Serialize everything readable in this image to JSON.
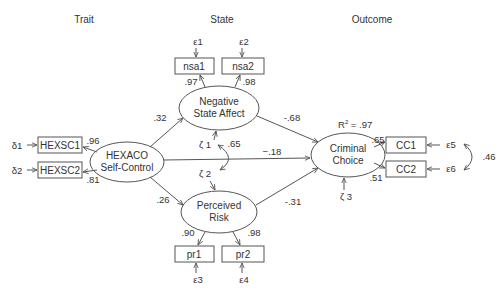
{
  "headers": {
    "trait": "Trait",
    "state": "State",
    "outcome": "Outcome"
  },
  "latent": {
    "hexaco": {
      "line1": "HEXACO",
      "line2": "Self-Control"
    },
    "nsa": {
      "line1": "Negative",
      "line2": "State Affect"
    },
    "pr": {
      "line1": "Perceived",
      "line2": "Risk"
    },
    "cc": {
      "line1": "Criminal",
      "line2": "Choice"
    }
  },
  "indicators": {
    "hexsc1": "HEXSC1",
    "hexsc2": "HEXSC2",
    "nsa1": "nsa1",
    "nsa2": "nsa2",
    "pr1": "pr1",
    "pr2": "pr2",
    "cc1": "CC1",
    "cc2": "CC2"
  },
  "errors": {
    "d1": "δ1",
    "d2": "δ2",
    "e1": "ε1",
    "e2": "ε2",
    "e3": "ε3",
    "e4": "ε4",
    "e5": "ε5",
    "e6": "ε6",
    "z1": "ζ 1",
    "z2": "ζ 2",
    "z3": "ζ 3"
  },
  "loadings": {
    "hexsc1": ".96",
    "hexsc2": ".81",
    "nsa1": ".97",
    "nsa2": ".98",
    "pr1": ".90",
    "pr2": ".98",
    "cc1": ".65",
    "cc2": ".51"
  },
  "paths": {
    "hexaco_nsa": ".32",
    "hexaco_pr": ".26",
    "hexaco_cc": "−.18",
    "nsa_cc": "-.68",
    "pr_cc": "-.31"
  },
  "covariances": {
    "z1_z2": ".65",
    "e5_e6": ".46"
  },
  "r_squared": {
    "label": "R",
    "sup": "2",
    "value": " = .97"
  },
  "colors": {
    "line": "#555555",
    "text": "#333333",
    "background": "#ffffff"
  }
}
